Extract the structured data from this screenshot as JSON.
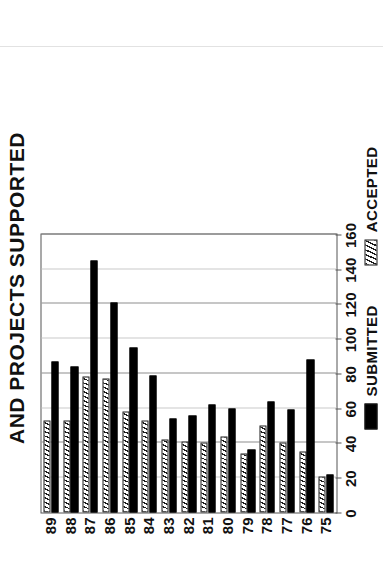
{
  "figure": {
    "title": "AND PROJECTS SUPPORTED",
    "orientation": "rotated-90-ccw",
    "clipped_title_note": "leading text cut off at page edge"
  },
  "legend": {
    "position": "bottom-center",
    "entries": [
      {
        "label": "SUBMITTED",
        "swatch": "solid-black-swatch",
        "color": "#000000"
      },
      {
        "label": "ACCEPTED",
        "swatch": "hatched-swatch",
        "color": "#1a1a1a"
      }
    ]
  },
  "axis": {
    "value_ticks": [
      "0",
      "20",
      "40",
      "60",
      "80",
      "100",
      "120",
      "140",
      "160"
    ],
    "value_tick_numbers": [
      0,
      20,
      40,
      60,
      80,
      100,
      120,
      140,
      160
    ],
    "category_ticks": [
      "75",
      "76",
      "77",
      "78",
      "79",
      "80",
      "81",
      "82",
      "83",
      "84",
      "85",
      "86",
      "87",
      "88",
      "89"
    ]
  },
  "chart_data": {
    "type": "bar",
    "title": "AND PROJECTS SUPPORTED",
    "xlabel": "",
    "ylabel": "",
    "orientation": "horizontal",
    "grid": true,
    "legend_position": "bottom",
    "categories": [
      "75",
      "76",
      "77",
      "78",
      "79",
      "80",
      "81",
      "82",
      "83",
      "84",
      "85",
      "86",
      "87",
      "88",
      "89"
    ],
    "xlim": [
      0,
      160
    ],
    "xticks": [
      0,
      20,
      40,
      60,
      80,
      100,
      120,
      140,
      160
    ],
    "series": [
      {
        "name": "SUBMITTED",
        "color": "#000000",
        "values": [
          22,
          88,
          59,
          64,
          36,
          60,
          62,
          56,
          54,
          79,
          95,
          121,
          145,
          84,
          87
        ]
      },
      {
        "name": "ACCEPTED",
        "color": "#1a1a1a",
        "pattern": "hatch",
        "values": [
          21,
          35,
          40,
          50,
          34,
          44,
          40,
          41,
          42,
          53,
          58,
          77,
          78,
          53,
          53
        ]
      }
    ]
  }
}
